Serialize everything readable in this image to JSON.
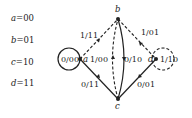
{
  "legend": [
    {
      "state": "a",
      "code": "00"
    },
    {
      "state": "b",
      "code": "01"
    },
    {
      "state": "c",
      "code": "10"
    },
    {
      "state": "d",
      "code": "11"
    }
  ],
  "nodes": [
    {
      "id": "a",
      "label": "a"
    },
    {
      "id": "b",
      "label": "b"
    },
    {
      "id": "c",
      "label": "c"
    },
    {
      "id": "d",
      "label": "d"
    }
  ],
  "edges": [
    {
      "from": "a",
      "to": "a",
      "label": "0/00",
      "style": "solid"
    },
    {
      "from": "a",
      "to": "b",
      "label": "1/11",
      "style": "dashed"
    },
    {
      "from": "c",
      "to": "a",
      "label": "0/11",
      "style": "solid"
    },
    {
      "from": "c",
      "to": "b",
      "label": "1/00",
      "style": "dashed"
    },
    {
      "from": "b",
      "to": "c",
      "label": "0/10",
      "style": "solid"
    },
    {
      "from": "b",
      "to": "d",
      "label": "1/01",
      "style": "dashed"
    },
    {
      "from": "c",
      "to": "d",
      "label": "0/01",
      "style": "solid"
    },
    {
      "from": "d",
      "to": "d",
      "label": "1/10",
      "style": "dashed"
    }
  ]
}
